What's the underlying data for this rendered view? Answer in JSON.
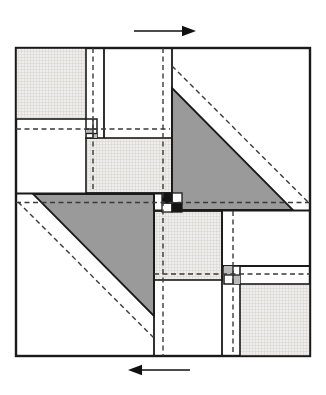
{
  "figure": {
    "canvas": {
      "width": 326,
      "height": 395
    },
    "colors": {
      "background": "#ffffff",
      "outline": "#1a1a1a",
      "dashed": "#3a3a3a",
      "triangle_fill": "#9a9a9a",
      "stipple_base": "#efeeec",
      "stipple_line": "#d8d7d3",
      "gray_cell": "#b9b9b9",
      "black_cell": "#141414",
      "white_cell": "#ffffff",
      "arrow": "#111111"
    },
    "outer_square": {
      "x": 16,
      "y": 48,
      "w": 294,
      "h": 308,
      "stroke_w": 2.4
    },
    "stippled_squares": [
      {
        "name": "stippled-square-top-left",
        "x": 16,
        "y": 48,
        "w": 70,
        "h": 71
      },
      {
        "name": "stippled-square-mid-left",
        "x": 86,
        "y": 138,
        "w": 86,
        "h": 55
      },
      {
        "name": "stippled-square-mid-right",
        "x": 154,
        "y": 211,
        "w": 68,
        "h": 69
      },
      {
        "name": "stippled-square-bottom-right",
        "x": 240,
        "y": 284,
        "w": 70,
        "h": 72
      }
    ],
    "triangles": [
      {
        "name": "shaded-triangle-upper-right",
        "points": [
          [
            172,
            88
          ],
          [
            172,
            210
          ],
          [
            293,
            210
          ]
        ]
      },
      {
        "name": "shaded-triangle-lower-left",
        "points": [
          [
            33,
            194
          ],
          [
            154,
            194
          ],
          [
            154,
            316
          ]
        ]
      }
    ],
    "solid_lines": [
      {
        "x1": 104,
        "y1": 48,
        "x2": 104,
        "y2": 138,
        "w": 1.8
      },
      {
        "x1": 172,
        "y1": 48,
        "x2": 172,
        "y2": 194,
        "w": 1.8
      },
      {
        "x1": 16,
        "y1": 193.5,
        "x2": 172,
        "y2": 193.5,
        "w": 2.0
      },
      {
        "x1": 154,
        "y1": 210.5,
        "x2": 310,
        "y2": 210.5,
        "w": 2.0
      },
      {
        "x1": 154,
        "y1": 194,
        "x2": 154,
        "y2": 356,
        "w": 1.8
      },
      {
        "x1": 222,
        "y1": 211,
        "x2": 222,
        "y2": 356,
        "w": 1.8
      },
      {
        "x1": 222,
        "y1": 266,
        "x2": 310,
        "y2": 266,
        "w": 1.8
      }
    ],
    "mini_grids": [
      {
        "name": "mini-grid-upper-left",
        "x": 86,
        "y": 119,
        "w": 11,
        "h": 19,
        "v_lines": [
          93
        ],
        "h_lines": [
          129,
          133.5
        ],
        "gray_cells": [
          {
            "x": 86,
            "y": 129,
            "w": 7,
            "h": 4.5
          },
          {
            "x": 93,
            "y": 133.5,
            "w": 4,
            "h": 4.5
          }
        ]
      },
      {
        "name": "mini-grid-lower-right",
        "x": 224,
        "y": 266,
        "w": 16,
        "h": 18,
        "v_lines": [
          233
        ],
        "h_lines": [
          275
        ],
        "gray_cells": [
          {
            "x": 224,
            "y": 266,
            "w": 9,
            "h": 9
          },
          {
            "x": 233,
            "y": 275,
            "w": 7,
            "h": 9
          }
        ]
      }
    ],
    "center_checker": {
      "name": "center-checker",
      "white_cells": [
        {
          "x": 172,
          "y": 193,
          "w": 10,
          "h": 10
        },
        {
          "x": 162,
          "y": 203,
          "w": 10,
          "h": 9
        }
      ],
      "black_cells": [
        {
          "x": 162,
          "y": 193,
          "w": 10,
          "h": 10
        },
        {
          "x": 172,
          "y": 203,
          "w": 10,
          "h": 9
        }
      ]
    },
    "dashed_lines": [
      {
        "x1": 93,
        "y1": 48,
        "x2": 93,
        "y2": 193
      },
      {
        "x1": 163,
        "y1": 48,
        "x2": 163,
        "y2": 356
      },
      {
        "x1": 233,
        "y1": 211,
        "x2": 233,
        "y2": 356
      },
      {
        "x1": 16,
        "y1": 129,
        "x2": 170,
        "y2": 129
      },
      {
        "x1": 154,
        "y1": 274,
        "x2": 310,
        "y2": 274
      },
      {
        "x1": 16,
        "y1": 202.5,
        "x2": 310,
        "y2": 202.5
      },
      {
        "x1": 172,
        "y1": 66,
        "x2": 308,
        "y2": 202
      },
      {
        "x1": 18,
        "y1": 202,
        "x2": 154,
        "y2": 338
      }
    ],
    "arrows": [
      {
        "name": "shear-arrow-top",
        "tail": [
          134,
          31
        ],
        "tip": [
          196,
          31
        ],
        "head_len": 14,
        "head_half": 5.2,
        "shaft_w": 1.6
      },
      {
        "name": "shear-arrow-bottom",
        "tail": [
          190,
          370
        ],
        "tip": [
          128,
          370
        ],
        "head_len": 14,
        "head_half": 5.2,
        "shaft_w": 1.6
      }
    ]
  }
}
